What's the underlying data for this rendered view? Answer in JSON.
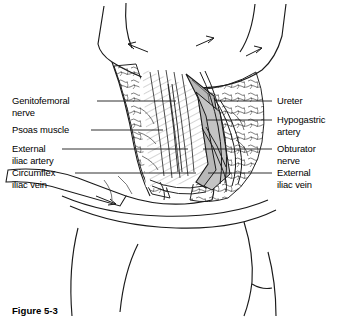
{
  "figure": {
    "caption": "Figure 5-3",
    "type": "anatomical-line-illustration",
    "ink_color": "#1a1a1a",
    "shade_color": "#b8b8b8",
    "background_color": "#ffffff"
  },
  "labels_left": [
    {
      "id": "genitofemoral-nerve",
      "line1": "Genitofemoral",
      "line2": "nerve",
      "text_x": 12,
      "text_y": 95,
      "leader_y": 101,
      "leader_x1": 97,
      "leader_x2": 176
    },
    {
      "id": "psoas-muscle",
      "line1": "Psoas muscle",
      "line2": "",
      "text_x": 12,
      "text_y": 124,
      "leader_y": 130,
      "leader_x1": 91,
      "leader_x2": 163
    },
    {
      "id": "external-iliac-artery",
      "line1": "External",
      "line2": "iliac artery",
      "text_x": 12,
      "text_y": 143,
      "leader_y": 149,
      "leader_x1": 62,
      "leader_x2": 188
    },
    {
      "id": "circumflex-iliac-vein",
      "line1": "Circumflex",
      "line2": "iliac vein",
      "text_x": 12,
      "text_y": 167,
      "leader_y": 173,
      "leader_x1": 75,
      "leader_x2": 196
    }
  ],
  "labels_right": [
    {
      "id": "ureter",
      "line1": "Ureter",
      "line2": "",
      "text_x": 277,
      "text_y": 95,
      "leader_y": 101,
      "leader_x1": 216,
      "leader_x2": 272
    },
    {
      "id": "hypogastric-artery",
      "line1": "Hypogastric",
      "line2": "artery",
      "text_x": 277,
      "text_y": 114,
      "leader_y": 120,
      "leader_x1": 207,
      "leader_x2": 272
    },
    {
      "id": "obturator-nerve",
      "line1": "Obturator",
      "line2": "nerve",
      "text_x": 277,
      "text_y": 143,
      "leader_y": 149,
      "leader_x1": 203,
      "leader_x2": 272
    },
    {
      "id": "external-iliac-vein",
      "line1": "External",
      "line2": "iliac vein",
      "text_x": 277,
      "text_y": 167,
      "leader_y": 173,
      "leader_x1": 208,
      "leader_x2": 272
    }
  ]
}
